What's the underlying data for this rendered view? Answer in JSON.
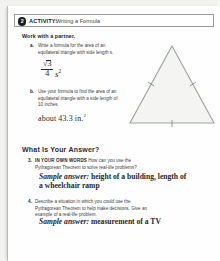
{
  "page": {
    "activity": {
      "number": "2",
      "label": "ACTIVITY:",
      "title": "Writing a Formula"
    },
    "lead_instruction": "Work with a partner.",
    "items": [
      {
        "marker": "a.",
        "text": "Write a formula for the area of an equilateral triangle with side length s."
      },
      {
        "marker": "b.",
        "text": "Use your formula to find the area of an equilateral triangle with a side length of 10 inches."
      }
    ],
    "formula": {
      "radicand": "3",
      "radical_sign": "√",
      "denominator": "4",
      "variable": "s",
      "exponent": "2"
    },
    "answer_b": {
      "text": "about 43.3 in.",
      "exponent": "2"
    },
    "figure": {
      "name": "equilateral-triangle",
      "fill_color": "#f4f5f3",
      "stroke_color": "#9aa29a",
      "tick_marks": 3
    },
    "answer_section": {
      "heading": "What Is Your Answer?",
      "questions": [
        {
          "marker": "3.",
          "caps": "IN YOUR OWN WORDS",
          "text": "How can you use the Pythagorean Theorem to solve real-life problems?",
          "sample_label": "Sample answer:",
          "sample_text": "height of a building, length of a wheelchair ramp"
        },
        {
          "marker": "4.",
          "caps": "",
          "text": "Describe a situation in which you could use the Pythagorean Theorem to help make decisions. Give an example of a real-life problem.",
          "sample_label": "Sample answer:",
          "sample_text": "measurement of a TV"
        }
      ]
    }
  }
}
